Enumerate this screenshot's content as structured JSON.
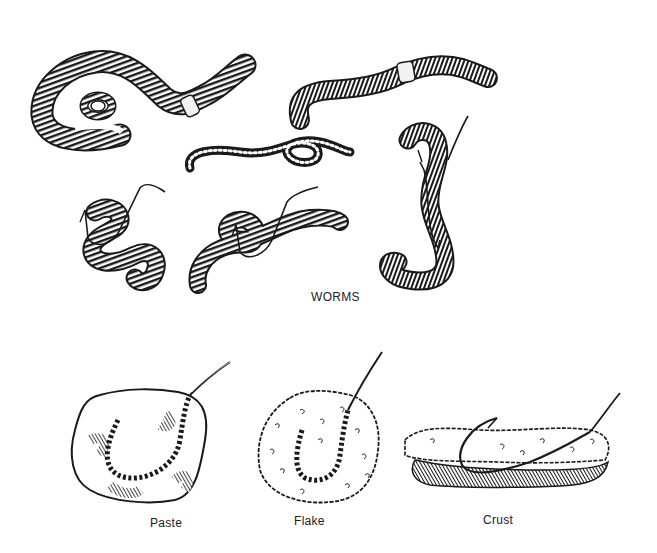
{
  "figure": {
    "sections": [
      {
        "id": "worms",
        "caption": "WORMS",
        "items": [
          {
            "name": "large-coiled-worm",
            "hooked": false
          },
          {
            "name": "long-worm-top-right",
            "hooked": false
          },
          {
            "name": "thin-coiled-worm",
            "hooked": false
          },
          {
            "name": "hooked-worm-left",
            "hooked": true
          },
          {
            "name": "hooked-worm-middle",
            "hooked": true
          },
          {
            "name": "hooked-worm-right-vertical",
            "hooked": true
          }
        ]
      },
      {
        "id": "baits",
        "items": [
          {
            "name": "paste-bait",
            "caption": "Paste"
          },
          {
            "name": "flake-bait",
            "caption": "Flake"
          },
          {
            "name": "crust-bait",
            "caption": "Crust"
          }
        ]
      }
    ],
    "colors": {
      "ink": "#1a1a1a",
      "background": "#ffffff"
    }
  }
}
